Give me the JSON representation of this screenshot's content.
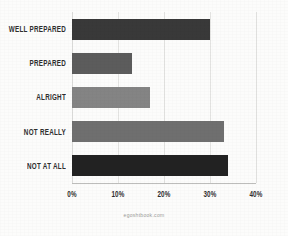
{
  "chart_data": {
    "type": "bar",
    "orientation": "horizontal",
    "title": "",
    "xlabel": "",
    "ylabel": "",
    "categories": [
      "WELL PREPARED",
      "PREPARED",
      "ALRIGHT",
      "NOT REALLY",
      "NOT AT ALL"
    ],
    "values": [
      30,
      13,
      17,
      33,
      34
    ],
    "value_suffix": "%",
    "xlim": [
      0,
      40
    ],
    "xticks": [
      0,
      10,
      20,
      30,
      40
    ],
    "xtick_labels": [
      "0%",
      "10%",
      "20%",
      "30%",
      "40%"
    ],
    "grid": true,
    "grid_axis": "x",
    "legend": false,
    "legend_position": "none",
    "bar_colors": [
      "#393939",
      "#5c5c5c",
      "#848484",
      "#6f6f6f",
      "#222222"
    ],
    "series": [
      {
        "name": "Share of respondents",
        "values": [
          30,
          13,
          17,
          33,
          34
        ]
      }
    ]
  },
  "bars": [
    {
      "label": "WELL PREPARED",
      "value": 30,
      "color": "#393939"
    },
    {
      "label": "PREPARED",
      "value": 13,
      "color": "#5c5c5c"
    },
    {
      "label": "ALRIGHT",
      "value": 17,
      "color": "#848484"
    },
    {
      "label": "NOT REALLY",
      "value": 33,
      "color": "#6f6f6f"
    },
    {
      "label": "NOT AT ALL",
      "value": 34,
      "color": "#222222"
    }
  ],
  "axis": {
    "ticks": [
      {
        "label": "0%",
        "value": 0
      },
      {
        "label": "10%",
        "value": 10
      },
      {
        "label": "20%",
        "value": 20
      },
      {
        "label": "30%",
        "value": 30
      },
      {
        "label": "40%",
        "value": 40
      }
    ]
  },
  "watermark": {
    "text": "egoshtbook.com"
  },
  "style": {
    "background": "#fcfcfb",
    "grid_color": "#e3e3e1",
    "axis_line_color": "#bdbdbb",
    "label_color": "#2e2e2e",
    "watermark_color": "#9a9a98"
  }
}
